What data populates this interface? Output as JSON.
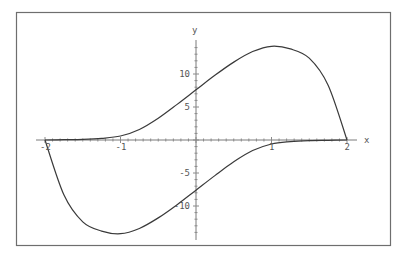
{
  "chart_data": {
    "type": "line",
    "title": "",
    "xlabel": "x",
    "ylabel": "y",
    "xlim": [
      -2,
      2
    ],
    "ylim": [
      -14.5,
      14.5
    ],
    "grid": false,
    "legend": null,
    "x_ticks": [
      "-2",
      "-1",
      "1",
      "2"
    ],
    "y_ticks": [
      "10",
      "5",
      "-5",
      "-10"
    ],
    "series": [
      {
        "name": "upper branch",
        "x": [
          -2,
          -1.75,
          -1.5,
          -1.25,
          -1,
          -0.75,
          -0.5,
          -0.25,
          0,
          0.25,
          0.5,
          0.75,
          1,
          1.25,
          1.5,
          1.75,
          2
        ],
        "y": [
          0,
          0.05,
          0.1,
          0.25,
          0.6,
          1.6,
          3.3,
          5.4,
          7.6,
          9.8,
          11.8,
          13.4,
          14.2,
          13.8,
          12.4,
          8.3,
          0
        ]
      },
      {
        "name": "lower branch",
        "x": [
          -2,
          -1.75,
          -1.5,
          -1.25,
          -1,
          -0.75,
          -0.5,
          -0.25,
          0,
          0.25,
          0.5,
          0.75,
          1,
          1.25,
          1.5,
          1.75,
          2
        ],
        "y": [
          0,
          -8.3,
          -12.4,
          -13.8,
          -14.2,
          -13.4,
          -11.8,
          -9.8,
          -7.6,
          -5.4,
          -3.3,
          -1.6,
          -0.6,
          -0.25,
          -0.1,
          -0.05,
          0
        ]
      }
    ]
  },
  "axes": {
    "x_label": "x",
    "y_label": "y"
  }
}
